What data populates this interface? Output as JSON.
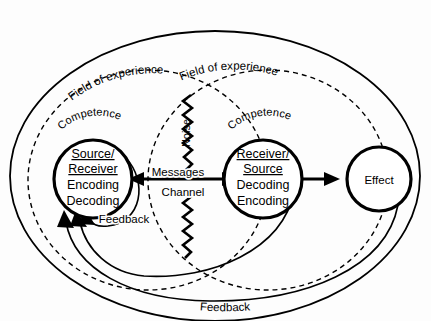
{
  "diagram": {
    "title": "Context",
    "type": "communication-model",
    "outer_boundary_label": "Context",
    "fields_of_experience": [
      {
        "id": "left",
        "label": "Field of experience"
      },
      {
        "id": "right",
        "label": "Field of experience"
      }
    ],
    "competence_labels": [
      {
        "id": "left",
        "label": "Competence"
      },
      {
        "id": "right",
        "label": "Competence"
      }
    ],
    "left_node": {
      "line1": "Source/",
      "line2": "Receiver",
      "line3": "Encoding",
      "line4": "Decoding"
    },
    "right_node": {
      "line1": "Receiver/",
      "line2": "Source",
      "line3": "Decoding",
      "line4": "Encoding"
    },
    "effect_node": {
      "label": "Effect"
    },
    "channel": {
      "messages_label": "Messages",
      "channel_label": "Channel"
    },
    "noise": {
      "label": "Noise"
    },
    "feedback_near": {
      "label": "Feedback"
    },
    "feedback_far": {
      "label": "Feedback"
    },
    "colors": {
      "ink": "#000000",
      "paper": "#fdfdfd"
    }
  }
}
